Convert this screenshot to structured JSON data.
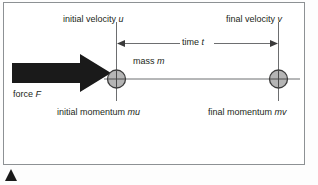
{
  "figure": {
    "kind": "physics-force-momentum-diagram",
    "frame": {
      "border_color": "#8d9194",
      "background_color": "#ffffff"
    },
    "labels": {
      "initial_velocity": "initial velocity ",
      "initial_velocity_var": "u",
      "final_velocity": "final velocity ",
      "final_velocity_var": "v",
      "time": "time ",
      "time_var": "t",
      "mass": "mass ",
      "mass_var": "m",
      "force": "force ",
      "force_var": "F",
      "initial_momentum": "initial momentum ",
      "initial_momentum_var": "mu",
      "final_momentum": "final momentum ",
      "final_momentum_var": "mv"
    },
    "colors": {
      "line": "#58595b",
      "axis": "#6d6e70",
      "mass_fill": "#b5b5b5",
      "mass_stroke": "#3b3b3b",
      "arrow_fill": "#1a1a1a",
      "text": "#231f20",
      "marker": "#1a1a1a"
    },
    "geometry": {
      "axis_y": 79,
      "axis_x_start": 104,
      "axis_x_end": 300,
      "mass_initial_cx": 116,
      "mass_final_cx": 278,
      "mass_radius": 9,
      "extension_line_top": 22,
      "extension_line_bottom": 101,
      "dimension_line_y": 43,
      "force_arrow_x_start": 12,
      "force_arrow_x_tip": 111
    }
  }
}
